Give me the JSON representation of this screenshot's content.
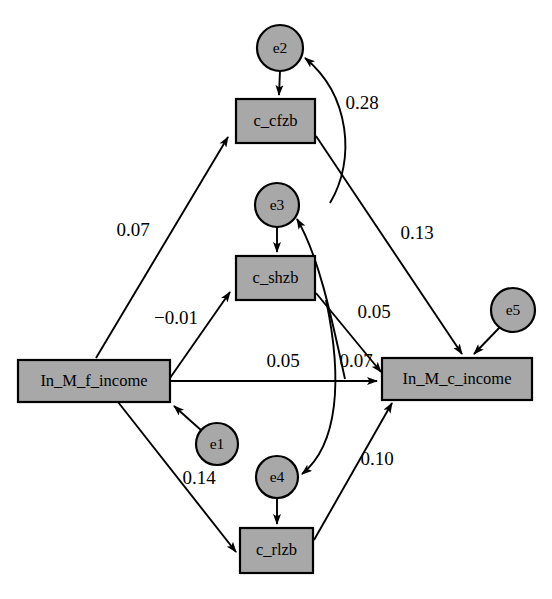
{
  "diagram": {
    "type": "path-diagram",
    "title": "",
    "style": {
      "node_fill": "#a8a8a8",
      "node_stroke": "#000000",
      "background": "#ffffff",
      "edge_color": "#000000"
    },
    "observed_variables": [
      {
        "id": "f_income",
        "label": "In_M_f_income",
        "shape": "rectangle",
        "x": 18,
        "y": 360,
        "w": 152,
        "h": 42
      },
      {
        "id": "c_income",
        "label": "In_M_c_income",
        "shape": "rectangle",
        "x": 382,
        "y": 358,
        "w": 150,
        "h": 42
      },
      {
        "id": "c_cfzb",
        "label": "c_cfzb",
        "shape": "rectangle",
        "x": 236,
        "y": 99,
        "w": 79,
        "h": 44
      },
      {
        "id": "c_shzb",
        "label": "c_shzb",
        "shape": "rectangle",
        "x": 236,
        "y": 256,
        "w": 79,
        "h": 44
      },
      {
        "id": "c_rlzb",
        "label": "c_rlzb",
        "shape": "rectangle",
        "x": 240,
        "y": 528,
        "w": 73,
        "h": 45
      }
    ],
    "error_terms": [
      {
        "id": "e1",
        "label": "e1",
        "shape": "circle",
        "cx": 217,
        "cy": 444,
        "r": 21,
        "target": "f_income"
      },
      {
        "id": "e2",
        "label": "e2",
        "shape": "circle",
        "cx": 280,
        "cy": 48,
        "r": 23,
        "target": "c_cfzb"
      },
      {
        "id": "e3",
        "label": "e3",
        "shape": "circle",
        "cx": 277,
        "cy": 205,
        "r": 22,
        "target": "c_shzb"
      },
      {
        "id": "e4",
        "label": "e4",
        "shape": "circle",
        "cx": 277,
        "cy": 477,
        "r": 21,
        "target": "c_rlzb"
      },
      {
        "id": "e5",
        "label": "e5",
        "shape": "circle",
        "cx": 513,
        "cy": 310,
        "r": 22,
        "target": "c_income"
      }
    ],
    "paths": [
      {
        "id": "p-f-cfzb",
        "from": "f_income",
        "to": "c_cfzb",
        "coefficient": "0.07",
        "label_x": 133,
        "label_y": 232
      },
      {
        "id": "p-f-shzb",
        "from": "f_income",
        "to": "c_shzb",
        "coefficient": "−0.01",
        "label_x": 176,
        "label_y": 320
      },
      {
        "id": "p-f-rlzb",
        "from": "f_income",
        "to": "c_rlzb",
        "coefficient": "0.14",
        "label_x": 199,
        "label_y": 480
      },
      {
        "id": "p-f-cinc",
        "from": "f_income",
        "to": "c_income",
        "coefficient": "0.05",
        "label_x": 283,
        "label_y": 363
      },
      {
        "id": "p-cfzb-cinc",
        "from": "c_cfzb",
        "to": "c_income",
        "coefficient": "0.13",
        "label_x": 417,
        "label_y": 235
      },
      {
        "id": "p-shzb-cinc",
        "from": "c_shzb",
        "to": "c_income",
        "coefficient": "0.05",
        "label_x": 374,
        "label_y": 314
      },
      {
        "id": "p-rlzb-cinc",
        "from": "c_rlzb",
        "to": "c_income",
        "coefficient": "0.10",
        "label_x": 377,
        "label_y": 461
      },
      {
        "id": "p-cinc-shzb-curve",
        "from": "c_income",
        "to": "e3",
        "coefficient": "0.07",
        "label_x": 356,
        "label_y": 363
      },
      {
        "id": "p-cfzb-e2-curve",
        "from": "c_cfzb",
        "to": "e2",
        "coefficient": "0.28",
        "label_x": 362,
        "label_y": 105
      },
      {
        "id": "p-e4-curve",
        "from": "c_income",
        "to": "e4",
        "coefficient": "",
        "label_x": 0,
        "label_y": 0
      }
    ],
    "coefficients": {
      "f_to_cfzb": "0.07",
      "f_to_shzb": "−0.01",
      "f_to_rlzb": "0.14",
      "f_to_cincome": "0.05",
      "cfzb_to_cincome": "0.13",
      "shzb_to_cincome": "0.05",
      "rlzb_to_cincome": "0.10",
      "cincome_curve_e3": "0.07",
      "cfzb_curve_e2": "0.28"
    }
  }
}
